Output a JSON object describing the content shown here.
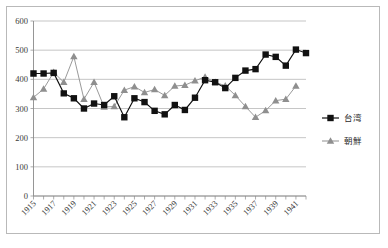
{
  "chart_data": {
    "type": "line",
    "title": "",
    "subtitle": "",
    "xlabel": "",
    "ylabel": "",
    "ylim": [
      0,
      600
    ],
    "ytick_labels": [
      "0",
      "100",
      "200",
      "300",
      "400",
      "500",
      "600"
    ],
    "ytick_values": [
      0,
      100,
      200,
      300,
      400,
      500,
      600
    ],
    "xlim": [
      1915,
      1942
    ],
    "x": [
      1915,
      1916,
      1917,
      1918,
      1919,
      1920,
      1921,
      1922,
      1923,
      1924,
      1925,
      1926,
      1927,
      1928,
      1929,
      1930,
      1931,
      1932,
      1933,
      1934,
      1935,
      1936,
      1937,
      1938,
      1939,
      1940,
      1941,
      1942
    ],
    "xtick_labels": [
      "1915",
      "1917",
      "1919",
      "1921",
      "1923",
      "1925",
      "1927",
      "1929",
      "1931",
      "1933",
      "1935",
      "1937",
      "1939",
      "1941"
    ],
    "xtick_values": [
      1915,
      1917,
      1919,
      1921,
      1923,
      1925,
      1927,
      1929,
      1931,
      1933,
      1935,
      1937,
      1939,
      1941
    ],
    "grid": true,
    "grid_axis": "y",
    "legend_position": "right",
    "series": [
      {
        "name": "台湾",
        "marker": "square",
        "color": "#111111",
        "values": [
          420,
          420,
          422,
          352,
          335,
          300,
          317,
          312,
          342,
          270,
          335,
          322,
          292,
          280,
          312,
          295,
          337,
          397,
          390,
          370,
          405,
          430,
          435,
          485,
          477,
          447,
          502,
          490
        ]
      },
      {
        "name": "朝鮮",
        "marker": "triangle",
        "color": "#8f8f8f",
        "values": [
          338,
          367,
          424,
          390,
          478,
          332,
          390,
          305,
          307,
          363,
          375,
          355,
          365,
          345,
          377,
          380,
          395,
          408,
          390,
          378,
          345,
          307,
          270,
          293,
          327,
          332,
          377,
          null
        ]
      }
    ]
  },
  "legend": {
    "items": [
      {
        "label": "台湾",
        "marker": "square-marker",
        "color": "#111111"
      },
      {
        "label": "朝鮮",
        "marker": "triangle-marker",
        "color": "#8f8f8f"
      }
    ]
  }
}
